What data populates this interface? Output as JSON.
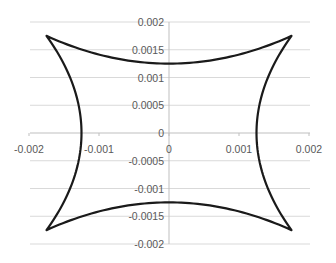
{
  "chart_data": {
    "type": "scatter",
    "title": "",
    "xlabel": "",
    "ylabel": "",
    "xlim": [
      -0.002,
      0.002
    ],
    "ylim": [
      -0.002,
      0.002
    ],
    "x_ticks": [
      "-0.002",
      "-0.001",
      "0",
      "0.001",
      "0.002"
    ],
    "y_ticks": [
      "0.002",
      "0.0015",
      "0.001",
      "0.0005",
      "0",
      "-0.0005",
      "-0.001",
      "-0.0015",
      "-0.002"
    ],
    "grid": "horizontal",
    "legend": "none",
    "series": [
      {
        "name": "closed curve (four-cusp shape)",
        "line_color": "#1a1a1a",
        "cusps": [
          [
            -0.00175,
            0.00175
          ],
          [
            0.00175,
            0.00175
          ],
          [
            0.00175,
            -0.00175
          ],
          [
            -0.00175,
            -0.00175
          ]
        ],
        "axis_intercepts": [
          [
            0,
            0.00125
          ],
          [
            0.00125,
            0
          ],
          [
            0,
            -0.00125
          ],
          [
            -0.00125,
            0
          ]
        ],
        "points": [
          [
            -0.00175,
            0.00175
          ],
          [
            -0.0014,
            0.00155
          ],
          [
            -0.001,
            0.00138
          ],
          [
            -0.0005,
            0.00128
          ],
          [
            0,
            0.00125
          ],
          [
            0.0005,
            0.00128
          ],
          [
            0.001,
            0.00138
          ],
          [
            0.0014,
            0.00155
          ],
          [
            0.00175,
            0.00175
          ],
          [
            0.00155,
            0.0014
          ],
          [
            0.00138,
            0.001
          ],
          [
            0.00128,
            0.0005
          ],
          [
            0.00125,
            0
          ],
          [
            0.00128,
            -0.0005
          ],
          [
            0.00138,
            -0.001
          ],
          [
            0.00155,
            -0.0014
          ],
          [
            0.00175,
            -0.00175
          ],
          [
            0.0014,
            -0.00155
          ],
          [
            0.001,
            -0.00138
          ],
          [
            0.0005,
            -0.00128
          ],
          [
            0,
            -0.00125
          ],
          [
            -0.0005,
            -0.00128
          ],
          [
            -0.001,
            -0.00138
          ],
          [
            -0.0014,
            -0.00155
          ],
          [
            -0.00175,
            -0.00175
          ],
          [
            -0.00155,
            -0.0014
          ],
          [
            -0.00138,
            -0.001
          ],
          [
            -0.00128,
            -0.0005
          ],
          [
            -0.00125,
            0
          ],
          [
            -0.00128,
            0.0005
          ],
          [
            -0.00138,
            0.001
          ],
          [
            -0.00155,
            0.0014
          ],
          [
            -0.00175,
            0.00175
          ]
        ]
      }
    ]
  },
  "colors": {
    "gridline": "#d9d9d9",
    "axis": "#bfbfbf",
    "curve": "#1a1a1a",
    "tick_label": "#595959"
  }
}
